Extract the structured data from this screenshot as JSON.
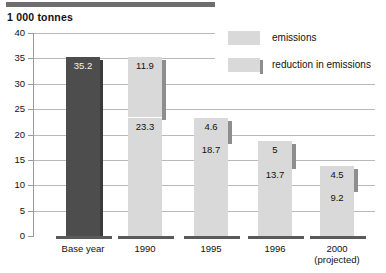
{
  "chart_data": {
    "type": "bar",
    "title": "1 000  tonnes",
    "subtitle": "",
    "xlabel": "",
    "ylabel": "1 000 tonnes",
    "ylim": [
      0,
      40
    ],
    "yticks": [
      0,
      5,
      10,
      15,
      20,
      25,
      30,
      35,
      40
    ],
    "grid": true,
    "stacked": true,
    "legend_position": "top-right",
    "categories": [
      "Base year",
      "1990",
      "1995",
      "1996",
      "2000 (projected)"
    ],
    "series": [
      {
        "name": "emissions",
        "values": [
          35.2,
          23.3,
          18.7,
          13.7,
          9.2
        ],
        "color": "#d9d9d9"
      },
      {
        "name": "reduction in emissions",
        "values": [
          null,
          11.9,
          4.6,
          5,
          4.5
        ],
        "color": "#d9d9d9"
      }
    ],
    "bars": [
      {
        "category": "Base year",
        "category_lines": [
          "Base year"
        ],
        "emissions": "35.2",
        "emissions_value": 35.2,
        "reduction": null,
        "reduction_value": null,
        "total": 35.2,
        "color": "#4d4d4d",
        "dark": true
      },
      {
        "category": "1990",
        "category_lines": [
          "1990"
        ],
        "emissions": "23.3",
        "emissions_value": 23.3,
        "reduction": "11.9",
        "reduction_value": 11.9,
        "total": 35.2,
        "color": "#d9d9d9",
        "dark": false
      },
      {
        "category": "1995",
        "category_lines": [
          "1995"
        ],
        "emissions": "18.7",
        "emissions_value": 18.7,
        "reduction": "4.6",
        "reduction_value": 4.6,
        "total": 23.3,
        "color": "#d9d9d9",
        "dark": false
      },
      {
        "category": "1996",
        "category_lines": [
          "1996"
        ],
        "emissions": "13.7",
        "emissions_value": 13.7,
        "reduction": "5",
        "reduction_value": 5,
        "total": 18.7,
        "color": "#d9d9d9",
        "dark": false
      },
      {
        "category": "2000 (projected)",
        "category_lines": [
          "2000",
          "(projected)"
        ],
        "emissions": "9.2",
        "emissions_value": 9.2,
        "reduction": "4.5",
        "reduction_value": 4.5,
        "total": 13.7,
        "color": "#d9d9d9",
        "dark": false
      }
    ],
    "legend": [
      {
        "label": "emissions",
        "color": "#d9d9d9",
        "shadow": false
      },
      {
        "label": "reduction in emissions",
        "color": "#d9d9d9",
        "shadow": true
      }
    ],
    "colors": {
      "base_year_bar": "#4d4d4d",
      "bar_fill": "#d9d9d9",
      "bar_shadow": "#8e8e8e",
      "gridline": "#b9b9b9",
      "axis": "#9a9a9a",
      "text": "#111111",
      "top_rule": "#6e6e6e",
      "pedestal": "#5a5a5a"
    }
  }
}
